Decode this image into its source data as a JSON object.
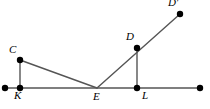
{
  "figure": {
    "type": "geometry-diagram",
    "canvas": {
      "width": 210,
      "height": 109
    },
    "colors": {
      "background": "#ffffff",
      "stroke": "#555555",
      "point_fill": "#000000",
      "label": "#000000"
    },
    "style": {
      "stroke_width": 1.4,
      "point_radius": 3.2
    },
    "points": [
      {
        "id": "ray_left_end",
        "label": "",
        "x": 5,
        "y": 88,
        "dot": true,
        "label_dx": 0,
        "label_dy": 0
      },
      {
        "id": "K",
        "label": "K",
        "x": 20,
        "y": 88,
        "dot": true,
        "label_dx": -6,
        "label_dy": 13
      },
      {
        "id": "C",
        "label": "C",
        "x": 20,
        "y": 60,
        "dot": true,
        "label_dx": -11,
        "label_dy": -5
      },
      {
        "id": "E",
        "label": "E",
        "x": 97,
        "y": 88,
        "dot": false,
        "label_dx": -4,
        "label_dy": 14
      },
      {
        "id": "L",
        "label": "L",
        "x": 137,
        "y": 88,
        "dot": true,
        "label_dx": 5,
        "label_dy": 13
      },
      {
        "id": "D",
        "label": "D",
        "x": 137,
        "y": 48,
        "dot": true,
        "label_dx": -11,
        "label_dy": -6
      },
      {
        "id": "Dprime",
        "label": "D′",
        "x": 180,
        "y": 14,
        "dot": true,
        "label_dx": -12,
        "label_dy": -6
      },
      {
        "id": "ray_right_end",
        "label": "",
        "x": 200,
        "y": 88,
        "dot": true,
        "label_dx": 0,
        "label_dy": 0
      }
    ],
    "segments": [
      {
        "id": "base-line",
        "name": "horizontal-base-line",
        "from": "ray_left_end",
        "to": "ray_right_end"
      },
      {
        "id": "seg-CK",
        "name": "segment-c-k",
        "from": "C",
        "to": "K"
      },
      {
        "id": "seg-CE",
        "name": "segment-c-e",
        "from": "C",
        "to": "E"
      },
      {
        "id": "seg-DL",
        "name": "segment-d-l",
        "from": "D",
        "to": "L"
      },
      {
        "id": "ray-EDprime",
        "name": "ray-e-through-d-to-dprime",
        "from": "E",
        "to": "Dprime"
      }
    ],
    "labels": {
      "K": "K",
      "C": "C",
      "E": "E",
      "L": "L",
      "D": "D",
      "Dprime": "D′"
    }
  },
  "chart_data": {
    "type": "scatter",
    "title": "",
    "xlabel": "",
    "ylabel": "",
    "categories": [
      "K",
      "C",
      "E",
      "L",
      "D",
      "D'"
    ],
    "x": [
      20,
      20,
      97,
      137,
      137,
      180
    ],
    "values": [
      88,
      60,
      88,
      88,
      48,
      14
    ],
    "xlim": [
      0,
      210
    ],
    "ylim": [
      0,
      109
    ],
    "grid": false,
    "legend": "none"
  }
}
